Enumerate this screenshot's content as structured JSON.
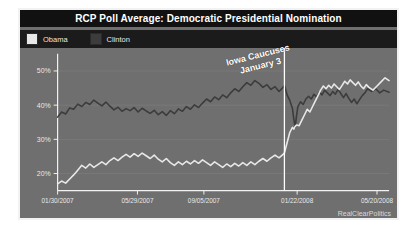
{
  "chart": {
    "title": "RCP Poll Average: Democratic Presidential Nomination",
    "watermark": "RealClearPolitics",
    "annotation_line1": "Iowa Caucuses",
    "annotation_line2": "January 3",
    "legend": [
      {
        "label": "Obama",
        "color": "#e8e8e8",
        "name": "obama"
      },
      {
        "label": "Clinton",
        "color": "#3c3c3c",
        "name": "clinton"
      }
    ],
    "colors": {
      "background": "#6f6f6f",
      "title_bar": "#111111",
      "legend_bar": "#1b1b1b",
      "frame": "#f2f2f2",
      "axis": "#f2f2f2",
      "grid": "#828282",
      "event_line": "#ffffff",
      "obama": "#e8e8e8",
      "clinton": "#3c3c3c"
    }
  },
  "chart_data": {
    "type": "line",
    "title": "RCP Poll Average: Democratic Presidential Nomination",
    "xlabel": "",
    "ylabel": "",
    "ylim": [
      15,
      55
    ],
    "yticks": [
      20,
      30,
      40,
      50
    ],
    "ytick_labels": [
      "20%",
      "30%",
      "40%",
      "50%"
    ],
    "grid": true,
    "legend_position": "top-left",
    "xtick_labels": [
      "01/30/2007",
      "05/29/2007",
      "09/05/2007",
      "01/22/2008",
      "05/20/2008"
    ],
    "xtick_positions": [
      0,
      119,
      218,
      357,
      476
    ],
    "x_range": [
      0,
      494
    ],
    "annotations": [
      {
        "label": "Iowa Caucuses January 3",
        "x": 338,
        "type": "vline"
      }
    ],
    "series": [
      {
        "name": "Clinton",
        "color": "#3c3c3c",
        "points": [
          [
            0,
            36.5
          ],
          [
            6,
            38.0
          ],
          [
            12,
            37.4
          ],
          [
            18,
            39.2
          ],
          [
            24,
            38.8
          ],
          [
            30,
            40.3
          ],
          [
            36,
            39.6
          ],
          [
            42,
            40.8
          ],
          [
            48,
            40.2
          ],
          [
            54,
            41.5
          ],
          [
            60,
            40.6
          ],
          [
            66,
            39.8
          ],
          [
            72,
            40.9
          ],
          [
            78,
            39.7
          ],
          [
            84,
            38.6
          ],
          [
            90,
            39.4
          ],
          [
            96,
            38.2
          ],
          [
            102,
            39.0
          ],
          [
            108,
            38.4
          ],
          [
            114,
            39.3
          ],
          [
            120,
            38.0
          ],
          [
            126,
            39.1
          ],
          [
            132,
            38.3
          ],
          [
            138,
            37.6
          ],
          [
            144,
            38.5
          ],
          [
            150,
            37.2
          ],
          [
            156,
            38.1
          ],
          [
            162,
            37.0
          ],
          [
            168,
            38.4
          ],
          [
            174,
            37.5
          ],
          [
            180,
            38.9
          ],
          [
            186,
            38.2
          ],
          [
            192,
            39.6
          ],
          [
            198,
            38.8
          ],
          [
            204,
            40.1
          ],
          [
            210,
            39.3
          ],
          [
            216,
            40.6
          ],
          [
            222,
            41.8
          ],
          [
            228,
            41.0
          ],
          [
            234,
            42.4
          ],
          [
            240,
            41.6
          ],
          [
            246,
            43.0
          ],
          [
            252,
            42.2
          ],
          [
            258,
            43.6
          ],
          [
            264,
            44.8
          ],
          [
            270,
            44.0
          ],
          [
            276,
            45.4
          ],
          [
            282,
            46.6
          ],
          [
            288,
            45.8
          ],
          [
            294,
            47.2
          ],
          [
            300,
            46.4
          ],
          [
            306,
            45.2
          ],
          [
            312,
            46.0
          ],
          [
            318,
            44.6
          ],
          [
            324,
            45.4
          ],
          [
            330,
            44.0
          ],
          [
            336,
            45.2
          ],
          [
            338,
            45.8
          ],
          [
            342,
            43.0
          ],
          [
            346,
            41.4
          ],
          [
            350,
            39.0
          ],
          [
            352,
            36.0
          ],
          [
            354,
            33.5
          ],
          [
            356,
            36.8
          ],
          [
            358,
            39.5
          ],
          [
            362,
            41.0
          ],
          [
            366,
            40.2
          ],
          [
            370,
            41.8
          ],
          [
            374,
            42.6
          ],
          [
            378,
            41.8
          ],
          [
            382,
            43.2
          ],
          [
            386,
            42.4
          ],
          [
            390,
            43.8
          ],
          [
            394,
            43.0
          ],
          [
            398,
            44.4
          ],
          [
            402,
            43.6
          ],
          [
            406,
            42.8
          ],
          [
            410,
            44.0
          ],
          [
            414,
            43.2
          ],
          [
            418,
            44.6
          ],
          [
            422,
            43.4
          ],
          [
            426,
            42.2
          ],
          [
            430,
            43.4
          ],
          [
            434,
            42.0
          ],
          [
            438,
            40.8
          ],
          [
            442,
            41.8
          ],
          [
            446,
            40.4
          ],
          [
            450,
            41.6
          ],
          [
            454,
            42.8
          ],
          [
            458,
            43.6
          ],
          [
            462,
            44.8
          ],
          [
            468,
            44.0
          ],
          [
            474,
            44.8
          ],
          [
            480,
            43.6
          ],
          [
            486,
            44.4
          ],
          [
            494,
            43.8
          ]
        ]
      },
      {
        "name": "Obama",
        "color": "#e8e8e8",
        "points": [
          [
            0,
            17.0
          ],
          [
            6,
            17.8
          ],
          [
            12,
            17.2
          ],
          [
            18,
            18.4
          ],
          [
            24,
            19.6
          ],
          [
            30,
            21.0
          ],
          [
            36,
            22.4
          ],
          [
            42,
            21.6
          ],
          [
            48,
            22.8
          ],
          [
            54,
            21.8
          ],
          [
            60,
            22.6
          ],
          [
            66,
            23.4
          ],
          [
            72,
            22.6
          ],
          [
            78,
            23.8
          ],
          [
            84,
            24.6
          ],
          [
            90,
            23.8
          ],
          [
            96,
            24.8
          ],
          [
            102,
            25.6
          ],
          [
            108,
            24.8
          ],
          [
            114,
            25.8
          ],
          [
            120,
            25.0
          ],
          [
            126,
            26.0
          ],
          [
            132,
            25.2
          ],
          [
            138,
            24.4
          ],
          [
            144,
            25.4
          ],
          [
            150,
            24.2
          ],
          [
            156,
            23.4
          ],
          [
            162,
            24.4
          ],
          [
            168,
            23.2
          ],
          [
            174,
            22.4
          ],
          [
            180,
            23.4
          ],
          [
            186,
            22.6
          ],
          [
            192,
            23.6
          ],
          [
            198,
            22.8
          ],
          [
            204,
            23.8
          ],
          [
            210,
            23.0
          ],
          [
            216,
            24.0
          ],
          [
            222,
            23.2
          ],
          [
            228,
            22.4
          ],
          [
            234,
            23.4
          ],
          [
            240,
            22.6
          ],
          [
            246,
            21.8
          ],
          [
            252,
            22.8
          ],
          [
            258,
            22.0
          ],
          [
            264,
            23.0
          ],
          [
            270,
            22.2
          ],
          [
            276,
            23.2
          ],
          [
            282,
            22.4
          ],
          [
            288,
            23.4
          ],
          [
            294,
            22.6
          ],
          [
            300,
            23.6
          ],
          [
            306,
            24.4
          ],
          [
            312,
            23.6
          ],
          [
            318,
            24.6
          ],
          [
            324,
            25.4
          ],
          [
            330,
            24.6
          ],
          [
            336,
            25.6
          ],
          [
            338,
            26.0
          ],
          [
            342,
            29.0
          ],
          [
            346,
            32.0
          ],
          [
            350,
            33.5
          ],
          [
            352,
            33.0
          ],
          [
            354,
            33.8
          ],
          [
            356,
            34.2
          ],
          [
            360,
            34.0
          ],
          [
            364,
            35.6
          ],
          [
            368,
            37.2
          ],
          [
            372,
            38.8
          ],
          [
            376,
            38.0
          ],
          [
            380,
            39.6
          ],
          [
            384,
            41.2
          ],
          [
            388,
            42.8
          ],
          [
            392,
            44.4
          ],
          [
            396,
            45.6
          ],
          [
            400,
            44.8
          ],
          [
            404,
            45.8
          ],
          [
            408,
            45.0
          ],
          [
            412,
            46.2
          ],
          [
            416,
            45.4
          ],
          [
            420,
            44.6
          ],
          [
            424,
            45.8
          ],
          [
            428,
            47.0
          ],
          [
            432,
            46.2
          ],
          [
            436,
            47.4
          ],
          [
            440,
            46.6
          ],
          [
            444,
            45.8
          ],
          [
            448,
            46.8
          ],
          [
            452,
            45.6
          ],
          [
            456,
            44.8
          ],
          [
            460,
            46.0
          ],
          [
            464,
            45.2
          ],
          [
            470,
            44.4
          ],
          [
            476,
            45.6
          ],
          [
            482,
            46.8
          ],
          [
            488,
            48.0
          ],
          [
            494,
            47.2
          ]
        ]
      }
    ]
  }
}
